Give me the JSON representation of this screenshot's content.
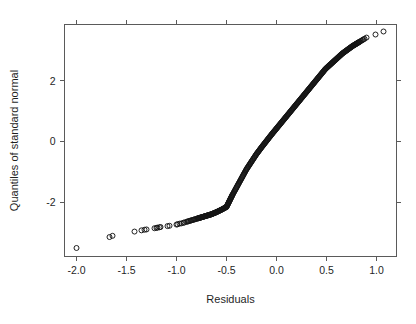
{
  "figure": {
    "background_color": "#ffffff",
    "axis_color": "#5a5a5a",
    "point_color": "#141414",
    "text_color": "#1f1f1f"
  },
  "chart_data": {
    "type": "scatter",
    "title": "",
    "subtitle": "",
    "xlabel": "Residuals",
    "ylabel": "Quantiles of standard normal",
    "xlim": [
      -2.12,
      1.2
    ],
    "ylim": [
      -3.78,
      3.85
    ],
    "xticks": [
      -2.0,
      -1.5,
      -1.0,
      -0.5,
      0.0,
      0.5,
      1.0
    ],
    "xticklabels": [
      "-2.0",
      "-1.5",
      "-1.0",
      "-0.5",
      "0.0",
      "0.5",
      "1.0"
    ],
    "yticks": [
      -2,
      0,
      2
    ],
    "yticklabels": [
      "-2",
      "0",
      "2"
    ],
    "grid": false,
    "legend": null,
    "marker": "open-circle",
    "marker_size_px": 5,
    "series": [
      {
        "name": "sample quantiles vs standard normal quantiles",
        "x": [
          -2.0,
          -1.67,
          -1.64,
          -1.42,
          -1.35,
          -1.32,
          -1.3,
          -1.22,
          -1.2,
          -1.19,
          -1.17,
          -1.16,
          -1.09,
          -1.07,
          -1.0,
          -0.99,
          -0.97,
          -0.95,
          -0.93,
          -0.92,
          -0.9,
          -0.89,
          -0.88,
          -0.87,
          -0.86,
          -0.85,
          -0.84,
          -0.83,
          -0.82,
          -0.81,
          -0.8,
          -0.79,
          -0.785,
          -0.78,
          -0.775,
          -0.77,
          -0.765,
          -0.76,
          -0.755,
          -0.75,
          -0.745,
          -0.74,
          -0.735,
          -0.73,
          -0.725,
          -0.72,
          -0.715,
          -0.71,
          -0.705,
          -0.7,
          -0.695,
          -0.69,
          -0.685,
          -0.68,
          -0.675,
          -0.67,
          -0.665,
          -0.66,
          -0.655,
          -0.65,
          -0.645,
          -0.64,
          -0.635,
          -0.63,
          -0.625,
          -0.62,
          -0.615,
          -0.61,
          -0.605,
          -0.6,
          -0.595,
          -0.59,
          -0.585,
          -0.58,
          -0.575,
          -0.57,
          -0.565,
          -0.56,
          -0.555,
          -0.55,
          -0.545,
          -0.54,
          -0.535,
          -0.53,
          -0.525,
          -0.52,
          -0.515,
          -0.51,
          -0.505,
          -0.5,
          -0.497,
          -0.494,
          -0.491,
          -0.488,
          -0.485,
          -0.482,
          -0.479,
          -0.476,
          -0.473,
          -0.47,
          -0.467,
          -0.464,
          -0.461,
          -0.458,
          -0.455,
          -0.452,
          -0.449,
          -0.446,
          -0.443,
          -0.44,
          -0.435,
          -0.43,
          -0.425,
          -0.42,
          -0.415,
          -0.41,
          -0.405,
          -0.4,
          -0.395,
          -0.39,
          -0.385,
          -0.38,
          -0.375,
          -0.37,
          -0.365,
          -0.36,
          -0.355,
          -0.35,
          -0.345,
          -0.34,
          -0.335,
          -0.33,
          -0.325,
          -0.32,
          -0.315,
          -0.31,
          -0.305,
          -0.3,
          -0.295,
          -0.29,
          -0.285,
          -0.28,
          -0.275,
          -0.27,
          -0.265,
          -0.26,
          -0.255,
          -0.25,
          -0.245,
          -0.24,
          -0.235,
          -0.23,
          -0.225,
          -0.22,
          -0.215,
          -0.21,
          -0.205,
          -0.2,
          -0.195,
          -0.19,
          -0.185,
          -0.18,
          -0.175,
          -0.17,
          -0.165,
          -0.16,
          -0.155,
          -0.15,
          -0.145,
          -0.14,
          -0.135,
          -0.13,
          -0.125,
          -0.12,
          -0.115,
          -0.11,
          -0.105,
          -0.1,
          -0.095,
          -0.09,
          -0.085,
          -0.08,
          -0.075,
          -0.07,
          -0.065,
          -0.06,
          -0.055,
          -0.05,
          -0.045,
          -0.04,
          -0.035,
          -0.03,
          -0.025,
          -0.02,
          -0.015,
          -0.01,
          -0.005,
          0.0,
          0.005,
          0.01,
          0.015,
          0.02,
          0.025,
          0.03,
          0.035,
          0.04,
          0.045,
          0.05,
          0.055,
          0.06,
          0.065,
          0.07,
          0.075,
          0.08,
          0.085,
          0.09,
          0.095,
          0.1,
          0.105,
          0.11,
          0.115,
          0.12,
          0.125,
          0.13,
          0.135,
          0.14,
          0.145,
          0.15,
          0.155,
          0.16,
          0.165,
          0.17,
          0.175,
          0.18,
          0.185,
          0.19,
          0.195,
          0.2,
          0.205,
          0.21,
          0.215,
          0.22,
          0.225,
          0.23,
          0.235,
          0.24,
          0.245,
          0.25,
          0.255,
          0.26,
          0.265,
          0.27,
          0.275,
          0.28,
          0.285,
          0.29,
          0.295,
          0.3,
          0.305,
          0.31,
          0.315,
          0.32,
          0.325,
          0.33,
          0.335,
          0.34,
          0.345,
          0.35,
          0.355,
          0.36,
          0.365,
          0.37,
          0.375,
          0.38,
          0.385,
          0.39,
          0.395,
          0.4,
          0.405,
          0.41,
          0.415,
          0.42,
          0.425,
          0.43,
          0.435,
          0.44,
          0.445,
          0.45,
          0.455,
          0.46,
          0.465,
          0.47,
          0.475,
          0.48,
          0.485,
          0.49,
          0.495,
          0.5,
          0.505,
          0.51,
          0.515,
          0.52,
          0.525,
          0.53,
          0.535,
          0.54,
          0.545,
          0.55,
          0.555,
          0.56,
          0.565,
          0.57,
          0.575,
          0.58,
          0.585,
          0.59,
          0.595,
          0.6,
          0.605,
          0.61,
          0.615,
          0.62,
          0.625,
          0.63,
          0.635,
          0.64,
          0.645,
          0.65,
          0.655,
          0.66,
          0.665,
          0.67,
          0.675,
          0.68,
          0.685,
          0.69,
          0.695,
          0.7,
          0.705,
          0.71,
          0.715,
          0.72,
          0.725,
          0.73,
          0.735,
          0.74,
          0.745,
          0.75,
          0.755,
          0.76,
          0.765,
          0.77,
          0.775,
          0.78,
          0.785,
          0.79,
          0.795,
          0.8,
          0.805,
          0.81,
          0.815,
          0.82,
          0.825,
          0.83,
          0.84,
          0.85,
          0.86,
          0.87,
          0.88,
          0.9,
          0.99,
          1.07
        ],
        "y": [
          -3.5,
          -3.14,
          -3.1,
          -2.96,
          -2.92,
          -2.9,
          -2.89,
          -2.85,
          -2.84,
          -2.83,
          -2.82,
          -2.81,
          -2.78,
          -2.77,
          -2.73,
          -2.72,
          -2.7,
          -2.69,
          -2.67,
          -2.66,
          -2.64,
          -2.63,
          -2.62,
          -2.61,
          -2.6,
          -2.59,
          -2.58,
          -2.57,
          -2.56,
          -2.55,
          -2.54,
          -2.53,
          -2.525,
          -2.52,
          -2.515,
          -2.51,
          -2.505,
          -2.5,
          -2.495,
          -2.49,
          -2.485,
          -2.48,
          -2.475,
          -2.47,
          -2.465,
          -2.46,
          -2.455,
          -2.45,
          -2.445,
          -2.44,
          -2.435,
          -2.43,
          -2.425,
          -2.42,
          -2.415,
          -2.41,
          -2.405,
          -2.4,
          -2.395,
          -2.39,
          -2.383,
          -2.376,
          -2.369,
          -2.362,
          -2.355,
          -2.348,
          -2.341,
          -2.334,
          -2.327,
          -2.32,
          -2.312,
          -2.304,
          -2.296,
          -2.288,
          -2.28,
          -2.272,
          -2.264,
          -2.256,
          -2.248,
          -2.24,
          -2.231,
          -2.222,
          -2.213,
          -2.204,
          -2.195,
          -2.186,
          -2.177,
          -2.168,
          -2.159,
          -2.15,
          -2.13,
          -2.11,
          -2.09,
          -2.07,
          -2.05,
          -2.03,
          -2.01,
          -1.99,
          -1.97,
          -1.95,
          -1.93,
          -1.91,
          -1.89,
          -1.87,
          -1.85,
          -1.83,
          -1.81,
          -1.79,
          -1.77,
          -1.75,
          -1.72,
          -1.69,
          -1.66,
          -1.63,
          -1.6,
          -1.57,
          -1.54,
          -1.51,
          -1.48,
          -1.45,
          -1.42,
          -1.39,
          -1.36,
          -1.33,
          -1.3,
          -1.27,
          -1.24,
          -1.21,
          -1.18,
          -1.15,
          -1.12,
          -1.09,
          -1.06,
          -1.03,
          -1.0,
          -0.97,
          -0.94,
          -0.91,
          -0.885,
          -0.86,
          -0.835,
          -0.81,
          -0.785,
          -0.76,
          -0.735,
          -0.71,
          -0.685,
          -0.66,
          -0.635,
          -0.61,
          -0.585,
          -0.56,
          -0.535,
          -0.51,
          -0.485,
          -0.46,
          -0.435,
          -0.41,
          -0.388,
          -0.366,
          -0.344,
          -0.322,
          -0.3,
          -0.278,
          -0.256,
          -0.234,
          -0.212,
          -0.19,
          -0.169,
          -0.148,
          -0.127,
          -0.106,
          -0.085,
          -0.064,
          -0.043,
          -0.022,
          -0.001,
          0.02,
          0.041,
          0.062,
          0.083,
          0.104,
          0.125,
          0.146,
          0.167,
          0.188,
          0.209,
          0.23,
          0.25,
          0.27,
          0.29,
          0.31,
          0.33,
          0.35,
          0.37,
          0.39,
          0.41,
          0.43,
          0.45,
          0.47,
          0.49,
          0.51,
          0.53,
          0.55,
          0.57,
          0.59,
          0.61,
          0.63,
          0.65,
          0.67,
          0.69,
          0.71,
          0.73,
          0.75,
          0.77,
          0.79,
          0.81,
          0.83,
          0.85,
          0.87,
          0.89,
          0.91,
          0.93,
          0.95,
          0.97,
          0.99,
          1.01,
          1.03,
          1.05,
          1.07,
          1.09,
          1.11,
          1.13,
          1.15,
          1.17,
          1.19,
          1.21,
          1.23,
          1.25,
          1.27,
          1.29,
          1.31,
          1.33,
          1.35,
          1.37,
          1.39,
          1.41,
          1.43,
          1.45,
          1.47,
          1.49,
          1.51,
          1.53,
          1.55,
          1.57,
          1.59,
          1.61,
          1.63,
          1.65,
          1.67,
          1.69,
          1.71,
          1.73,
          1.75,
          1.77,
          1.79,
          1.81,
          1.83,
          1.85,
          1.87,
          1.89,
          1.91,
          1.93,
          1.95,
          1.97,
          1.99,
          2.01,
          2.03,
          2.05,
          2.07,
          2.09,
          2.11,
          2.13,
          2.15,
          2.17,
          2.19,
          2.21,
          2.23,
          2.25,
          2.27,
          2.29,
          2.31,
          2.33,
          2.35,
          2.37,
          2.39,
          2.405,
          2.42,
          2.435,
          2.45,
          2.465,
          2.48,
          2.495,
          2.51,
          2.525,
          2.54,
          2.555,
          2.57,
          2.585,
          2.6,
          2.615,
          2.63,
          2.645,
          2.66,
          2.675,
          2.69,
          2.705,
          2.72,
          2.735,
          2.75,
          2.765,
          2.78,
          2.795,
          2.81,
          2.825,
          2.84,
          2.855,
          2.87,
          2.885,
          2.9,
          2.912,
          2.924,
          2.936,
          2.948,
          2.96,
          2.972,
          2.984,
          2.996,
          3.008,
          3.02,
          3.032,
          3.044,
          3.056,
          3.068,
          3.08,
          3.092,
          3.104,
          3.116,
          3.128,
          3.14,
          3.15,
          3.16,
          3.17,
          3.18,
          3.19,
          3.2,
          3.21,
          3.22,
          3.23,
          3.24,
          3.25,
          3.26,
          3.27,
          3.28,
          3.3,
          3.32,
          3.34,
          3.36,
          3.38,
          3.42,
          3.52,
          3.62
        ]
      }
    ]
  }
}
